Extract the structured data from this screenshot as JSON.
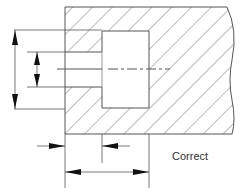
{
  "diagram": {
    "type": "engineering-section-dimensioning",
    "caption": "Correct",
    "colors": {
      "line": "#555555",
      "hatch": "#777777",
      "background": "#ffffff",
      "text": "#333333"
    },
    "elements": [
      "hatched sectioned block with break line on right",
      "counterbore hole (large bore) and through bore (small bore)",
      "dashed center line",
      "vertical diameter dimensions on left (large and small)",
      "horizontal depth dimensions below (counterbore depth and overall depth)"
    ]
  }
}
